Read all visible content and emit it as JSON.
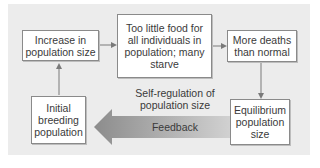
{
  "diagram": {
    "nodes": [
      {
        "id": "increase",
        "label": "Increase in population size"
      },
      {
        "id": "too_little_food",
        "label": "Too little food for all individuals in population; many starve"
      },
      {
        "id": "more_deaths",
        "label": "More deaths than normal"
      },
      {
        "id": "equilibrium",
        "label": "Equilibrium population size"
      },
      {
        "id": "initial",
        "label": "Initial breeding population"
      }
    ],
    "edges": [
      {
        "from": "initial",
        "to": "increase"
      },
      {
        "from": "increase",
        "to": "too_little_food"
      },
      {
        "from": "too_little_food",
        "to": "more_deaths"
      },
      {
        "from": "more_deaths",
        "to": "equilibrium"
      },
      {
        "from": "equilibrium",
        "to": "initial",
        "label": "Feedback"
      }
    ],
    "center_label_line1": "Self-regulation of",
    "center_label_line2": "population size",
    "feedback_label": "Feedback"
  },
  "colors": {
    "panel": "#ececec",
    "box_border": "#8a8a8a",
    "arrow": "#7a7a7a",
    "feedback_dark": "#8c8c8c",
    "feedback_light": "#d6d6d6"
  }
}
